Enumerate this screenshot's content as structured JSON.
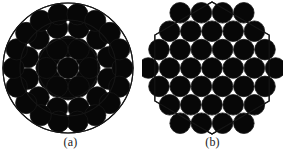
{
  "figure": {
    "background_color": "#ffffff",
    "stroke_color": "#161616",
    "fill_color": "#070707",
    "panels": [
      {
        "id": "panel-a",
        "caption": "(a)",
        "shape": "circle",
        "description": "circular fiber bundle cross-section with concentric boundary circles and close-packed round fibers",
        "boundary": {
          "type": "concentric-circles",
          "center_x": 68,
          "center_y": 68,
          "radii": [
            65,
            48,
            30
          ],
          "stroke_width": 1.1
        },
        "packing": {
          "fiber_radius": 10.6,
          "rings": [
            {
              "name": "core",
              "count": 7,
              "ring_radius": 0,
              "phase_deg": 0
            },
            {
              "name": "inner-ring",
              "count": 6,
              "ring_radius": 21.5,
              "phase_deg": 0
            },
            {
              "name": "middle-ring",
              "count": 12,
              "ring_radius": 41.5,
              "phase_deg": 15
            },
            {
              "name": "outer-ring",
              "count": 18,
              "ring_radius": 54.5,
              "phase_deg": 0
            }
          ],
          "total_fibers": 37
        }
      },
      {
        "id": "panel-b",
        "caption": "(b)",
        "shape": "hexagon",
        "description": "hexagonal fiber bundle cross-section with hexagonal boundary and close-packed round fibers",
        "boundary": {
          "type": "hexagon",
          "center_x": 70,
          "center_y": 68,
          "circumradius": 66,
          "orientation": "flat-top",
          "stroke_width": 1.1
        },
        "packing": {
          "fiber_radius": 10.3,
          "row_counts": [
            4,
            5,
            6,
            7,
            6,
            5,
            4
          ],
          "row_spacing": 18.4,
          "column_spacing": 21.2,
          "total_fibers": 37
        }
      }
    ]
  }
}
